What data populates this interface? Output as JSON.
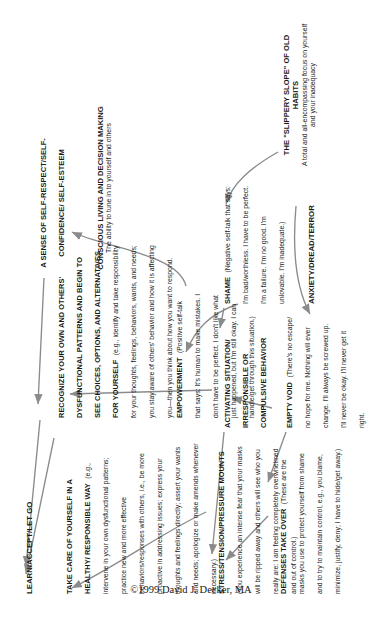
{
  "diagram": {
    "copyright": "©1999 David J. Decker, MA",
    "blocks": {
      "learn": {
        "heading": "LEARN/ACCEPT/LET GO",
        "body": ""
      },
      "take_care": {
        "heading": "TAKE CARE OF YOURSELF IN A HEALTHY/ RESPONSIBLE WAY",
        "body": "(e.g., intervene in your own dysfunctional patterns; practice new and more effective behaviors/responses with others, i.e., be more proactive in addressing issues; express your thoughts and feelings directly; assert your wants and needs; apologize or make amends whenever necessary.)"
      },
      "recognize": {
        "heading": "RECOGNIZE YOUR OWN AND OTHERS' DYSFUNCTIONAL PATTERNS AND BEGIN TO SEE CHOICES, OPTIONS, AND ALTERNATIVES FOR YOURSELF",
        "body": "(e.g., identify and take responsibility for your thoughts, feelings, behaviors, wants, and needs; you stay aware of others' behavior and how it is affecting you—then you think about how you want to respond."
      },
      "empowerment": {
        "heading": "EMPOWERMENT",
        "body": "(Positive self-talk that says: It's human to make mistakes. I don't have to be perfect. I don't like what just happened, but I'm still okay. I can handle/get through this situation.)"
      },
      "sense_of_self": {
        "heading": "A SENSE OF SELF-RESPECT/SELF-CONFIDENCE/ SELF-ESTEEM",
        "body": ""
      },
      "conscious_living": {
        "heading": "CONSCIOUS LIVING AND DECISION MAKING",
        "body": "The ability to tune in to yourself and others"
      },
      "stress": {
        "heading": "STRESS/TENSION/PRESSURE MOUNTS",
        "body": "(You experience an intense fear that your masks will be ripped away and others will see who you really are: I am feeling completely overwhelmed and out of control.)"
      },
      "defenses": {
        "heading": "DEFENSES TAKE OVER",
        "body": "(These are the masks you use to protect yourself from shame and to try to maintain control, e.g., you blame, minimize, justify, deny; I have to hide/get away.)"
      },
      "activating": {
        "heading": "ACTIVATING SITUATION/ IRRESPONSIBLE OR COMPULSIVE BEHAVIOR",
        "body": ""
      },
      "empty_void": {
        "heading": "EMPTY VOID",
        "body": "(There's no escape/ no hope for me. Nothing will ever change. I'll always be screwed up. I'll never be okay. I'll never get it right."
      },
      "shame": {
        "heading": "SHAME",
        "body": "(Negative self-talk that says: I'm bad/worthless. I have to be perfect. I'm a failure. I'm no good. I'm unlovable. I'm inadequate.)"
      },
      "anxiety": {
        "heading": "ANXIETY/DREAD/TERROR",
        "body": ""
      },
      "slippery_slope": {
        "heading": "THE \"SLIPPERY SLOPE\" OF OLD HABITS",
        "body": "A total and all-encompassing focus on yourself and your inadequacy"
      }
    },
    "colors": {
      "text": "#1a1a1a",
      "arrow": "#8b8b8b",
      "background": "#ffffff"
    }
  }
}
